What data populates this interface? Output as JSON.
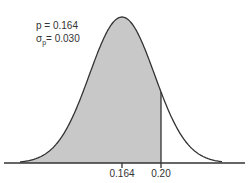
{
  "chart_data": {
    "type": "area",
    "title": "",
    "mean": 0.164,
    "sd": 0.03,
    "shade_upper_bound": 0.2,
    "annotations": {
      "p_line": "p = 0.164",
      "sigma_symbol": "σ",
      "sigma_subscript": "p",
      "sigma_value": "= 0.030"
    },
    "x_ticks": [
      {
        "value": 0.164,
        "label": "0.164"
      },
      {
        "value": 0.2,
        "label": "0.20"
      }
    ],
    "xlabel": "",
    "ylabel": "",
    "grid": false,
    "colors": {
      "fill": "#c8c8c8",
      "curve": "#333333",
      "axis": "#333333"
    }
  }
}
